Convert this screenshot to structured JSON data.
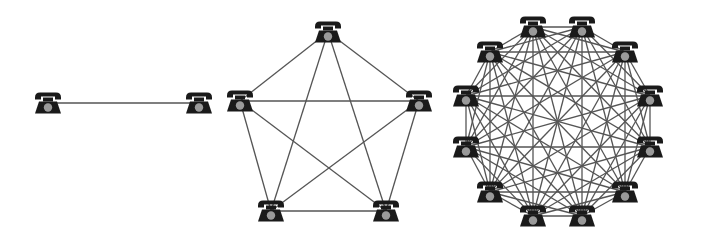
{
  "diagram": {
    "title": "",
    "colors": {
      "background": "#ffffff",
      "edge": "#555555",
      "phone_body": "#1a1a1a",
      "phone_dial": "#9a9a9a"
    },
    "node_icon": "telephone-icon",
    "icon_size": {
      "w": 28,
      "h": 23
    },
    "graphs": [
      {
        "name": "two-node-network",
        "node_count": 2,
        "edge_count": 1,
        "nodes": [
          {
            "x": 48,
            "y": 103
          },
          {
            "x": 199,
            "y": 103
          }
        ]
      },
      {
        "name": "five-node-network",
        "node_count": 5,
        "edge_count": 10,
        "nodes": [
          {
            "x": 328,
            "y": 32
          },
          {
            "x": 419,
            "y": 101
          },
          {
            "x": 386,
            "y": 211
          },
          {
            "x": 271,
            "y": 211
          },
          {
            "x": 240,
            "y": 101
          }
        ]
      },
      {
        "name": "twelve-node-network",
        "node_count": 12,
        "edge_count": 66,
        "nodes": [
          {
            "x": 582,
            "y": 27
          },
          {
            "x": 625,
            "y": 52
          },
          {
            "x": 650,
            "y": 96
          },
          {
            "x": 650,
            "y": 147
          },
          {
            "x": 625,
            "y": 192
          },
          {
            "x": 582,
            "y": 216
          },
          {
            "x": 533,
            "y": 216
          },
          {
            "x": 490,
            "y": 192
          },
          {
            "x": 466,
            "y": 147
          },
          {
            "x": 466,
            "y": 96
          },
          {
            "x": 490,
            "y": 52
          },
          {
            "x": 533,
            "y": 27
          }
        ]
      }
    ]
  }
}
